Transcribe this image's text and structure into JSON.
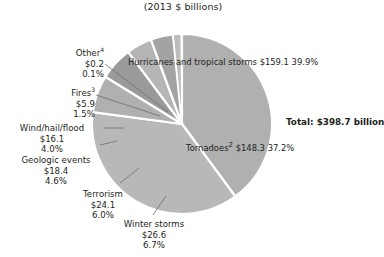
{
  "chart_data": {
    "type": "pie",
    "title": "(2013 $ billions)",
    "units": "2013 $ billions",
    "total_label": "Total:",
    "total_value": "$398.7 billion",
    "total_number": 398.7,
    "legend_position": "none",
    "grid": false,
    "categories": [
      "Hurricanes and tropical storms",
      "Tornadoes",
      "Winter storms",
      "Terrorism",
      "Geologic events",
      "Wind/hail/flood",
      "Fires",
      "Other"
    ],
    "values": [
      159.1,
      148.3,
      26.6,
      24.1,
      18.4,
      16.1,
      5.9,
      0.2
    ],
    "percents": [
      39.9,
      37.2,
      6.7,
      6.0,
      4.6,
      4.0,
      1.5,
      0.1
    ],
    "slices": [
      {
        "name": "Hurricanes and tropical storms",
        "label_line1": "Hurricanes and",
        "label_line2": "tropical storms",
        "value_text": "$159.1",
        "percent_text": "39.9%",
        "value": 159.1,
        "percent": 39.9,
        "footnote": "",
        "color": "#b0b0b0",
        "label_placement": "inside"
      },
      {
        "name": "Tornadoes",
        "label_line1": "Tornadoes",
        "label_line2": "",
        "value_text": "$148.3",
        "percent_text": "37.2%",
        "value": 148.3,
        "percent": 37.2,
        "footnote": "2",
        "color": "#b8b8b8",
        "label_placement": "inside"
      },
      {
        "name": "Winter storms",
        "label_line1": "Winter storms",
        "label_line2": "",
        "value_text": "$26.6",
        "percent_text": "6.7%",
        "value": 26.6,
        "percent": 6.7,
        "footnote": "",
        "color": "#b0b0b0",
        "label_placement": "outside"
      },
      {
        "name": "Terrorism",
        "label_line1": "Terrorism",
        "label_line2": "",
        "value_text": "$24.1",
        "percent_text": "6.0%",
        "value": 24.1,
        "percent": 6.0,
        "footnote": "",
        "color": "#9a9a9a",
        "label_placement": "outside"
      },
      {
        "name": "Geologic events",
        "label_line1": "Geologic events",
        "label_line2": "",
        "value_text": "$18.4",
        "percent_text": "4.6%",
        "value": 18.4,
        "percent": 4.6,
        "footnote": "",
        "color": "#b5b5b5",
        "label_placement": "outside"
      },
      {
        "name": "Wind/hail/flood",
        "label_line1": "Wind/hail/flood",
        "label_line2": "",
        "value_text": "$16.1",
        "percent_text": "4.0%",
        "value": 16.1,
        "percent": 4.0,
        "footnote": "",
        "color": "#a3a3a3",
        "label_placement": "outside"
      },
      {
        "name": "Fires",
        "label_line1": "Fires",
        "label_line2": "",
        "value_text": "$5.9",
        "percent_text": "1.5%",
        "value": 5.9,
        "percent": 1.5,
        "footnote": "3",
        "color": "#bdbdbd",
        "label_placement": "outside"
      },
      {
        "name": "Other",
        "label_line1": "Other",
        "label_line2": "",
        "value_text": "$0.2",
        "percent_text": "0.1%",
        "value": 0.2,
        "percent": 0.1,
        "footnote": "4",
        "color": "#9d9d9d",
        "label_placement": "outside"
      }
    ],
    "colors": {
      "slice_default": "#b0b0b0",
      "separator": "#ffffff",
      "text": "#231f20",
      "background": "#ffffff",
      "leader_line": "#6d6d6d"
    },
    "geometry": {
      "center_x": 182,
      "center_y": 124,
      "radius": 90,
      "start_angle_deg": 0
    }
  }
}
